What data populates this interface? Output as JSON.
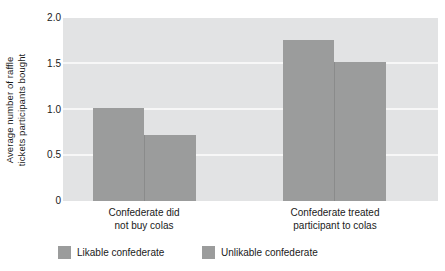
{
  "chart_data": {
    "type": "bar",
    "title": "",
    "subtitle": "",
    "xlabel": "",
    "ylabel": "Average number of raffle tickets participants bought",
    "ylabel_lines": [
      "Average number of raffle",
      "tickets participants bought"
    ],
    "categories": [
      "Confederate did not buy colas",
      "Confederate treated participant to colas"
    ],
    "category_lines": [
      [
        "Confederate did",
        "not buy colas"
      ],
      [
        "Confederate treated",
        "participant to colas"
      ]
    ],
    "series": [
      {
        "name": "Likable confederate",
        "values": [
          1.02,
          1.76
        ],
        "color": "#9b9c9c"
      },
      {
        "name": "Unlikable confederate",
        "values": [
          0.72,
          1.52
        ],
        "color": "#9b9c9c"
      }
    ],
    "ylim": [
      0,
      2.0
    ],
    "yticks": [
      2.0,
      1.5,
      1.0,
      0.5,
      0
    ],
    "ytick_labels": [
      "2.0",
      "1.5",
      "1.0",
      "0.5",
      "0"
    ],
    "grid": true,
    "grid_axis": "y",
    "grid_color": "#f7f7f7",
    "legend_position": "bottom",
    "plot_background": "#e2e3e4",
    "figure_background": "#ffffff"
  },
  "axis": {
    "ytick_0": "2.0",
    "ytick_1": "1.5",
    "ytick_2": "1.0",
    "ytick_3": "0.5",
    "ytick_4": "0"
  },
  "ylabel": {
    "line1": "Average number of raffle",
    "line2": "tickets participants bought"
  },
  "categories": {
    "cat0_line1": "Confederate did",
    "cat0_line2": "not buy colas",
    "cat1_line1": "Confederate treated",
    "cat1_line2": "participant to colas"
  },
  "legend": {
    "item0": "Likable confederate",
    "item1": "Unlikable confederate"
  }
}
